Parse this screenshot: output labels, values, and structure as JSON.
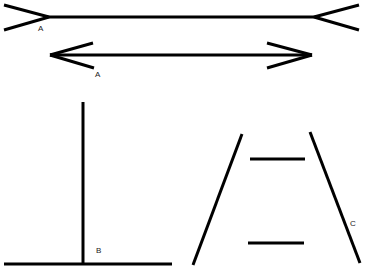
{
  "figure": {
    "stroke_color": "#000000",
    "background": "#ffffff"
  },
  "muller_lyer": {
    "top_line": {
      "label": "A",
      "shaft": [
        [
          49,
          17
        ],
        [
          314,
          17
        ]
      ],
      "fins": [
        [
          [
            4,
            5
          ],
          [
            49,
            17
          ]
        ],
        [
          [
            4,
            30
          ],
          [
            49,
            17
          ]
        ],
        [
          [
            359,
            5
          ],
          [
            314,
            17
          ]
        ],
        [
          [
            359,
            30
          ],
          [
            314,
            17
          ]
        ]
      ],
      "label_pos": [
        38,
        30
      ]
    },
    "bottom_line": {
      "label": "A",
      "shaft": [
        [
          50,
          55
        ],
        [
          312,
          55
        ]
      ],
      "fins": [
        [
          [
            50,
            55
          ],
          [
            93,
            43
          ]
        ],
        [
          [
            50,
            55
          ],
          [
            94,
            68
          ]
        ],
        [
          [
            312,
            55
          ],
          [
            267,
            43
          ]
        ],
        [
          [
            312,
            55
          ],
          [
            267,
            68
          ]
        ]
      ],
      "label_pos": [
        95,
        76
      ]
    }
  },
  "vertical_horizontal": {
    "label": "B",
    "vertical": [
      [
        83,
        102
      ],
      [
        83,
        264
      ]
    ],
    "horizontal": [
      [
        4,
        264
      ],
      [
        172,
        264
      ]
    ],
    "label_pos": [
      96,
      252
    ]
  },
  "ponzo": {
    "label": "C",
    "left_rail": [
      [
        242,
        134
      ],
      [
        193,
        265
      ]
    ],
    "right_rail": [
      [
        310,
        132
      ],
      [
        360,
        263
      ]
    ],
    "top_bar": [
      [
        250,
        159
      ],
      [
        305,
        159
      ]
    ],
    "bottom_bar": [
      [
        248,
        243
      ],
      [
        304,
        243
      ]
    ],
    "label_pos": [
      350,
      225
    ]
  }
}
